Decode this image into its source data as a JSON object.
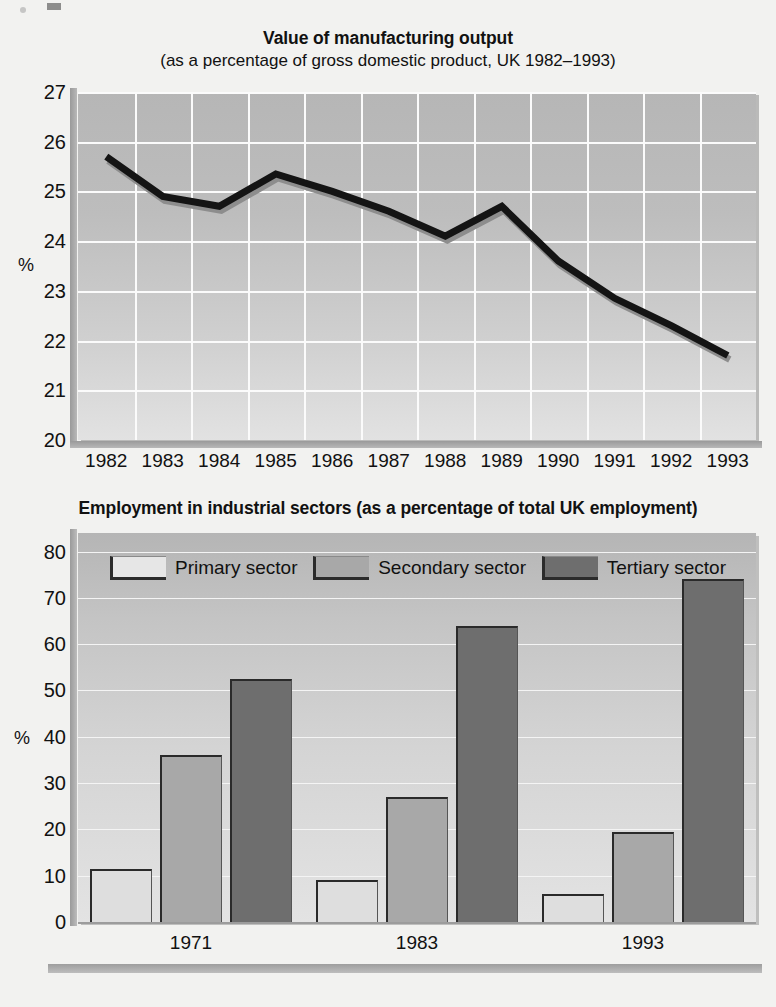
{
  "line_chart": {
    "title": "Value of manufacturing output",
    "subtitle": "(as a percentage of gross domestic product, UK 1982–1993)",
    "y_caption": "%"
  },
  "bar_chart": {
    "title": "Employment in industrial sectors (as a percentage of total UK employment)",
    "y_caption": "%",
    "legend": [
      {
        "label": "Primary sector",
        "key": "primary",
        "color": "#e6e6e6"
      },
      {
        "label": "Secondary sector",
        "key": "secondary",
        "color": "#a8a8a8"
      },
      {
        "label": "Tertiary sector",
        "key": "tertiary",
        "color": "#6e6e6e"
      }
    ]
  },
  "chart_data": [
    {
      "type": "line",
      "title": "Value of manufacturing output",
      "subtitle": "(as a percentage of gross domestic product, UK 1982–1993)",
      "xlabel": "",
      "ylabel": "%",
      "ylim": [
        20,
        27
      ],
      "yticks": [
        20,
        21,
        22,
        23,
        24,
        25,
        26,
        27
      ],
      "grid": true,
      "legend": "none",
      "categories": [
        "1982",
        "1983",
        "1984",
        "1985",
        "1986",
        "1987",
        "1988",
        "1989",
        "1990",
        "1991",
        "1992",
        "1993"
      ],
      "values": [
        25.7,
        24.9,
        24.7,
        25.35,
        25.0,
        24.6,
        24.1,
        24.7,
        23.6,
        22.85,
        22.3,
        21.7
      ],
      "series": [
        {
          "name": "Manufacturing output as % of GDP",
          "values": [
            25.7,
            24.9,
            24.7,
            25.35,
            25.0,
            24.6,
            24.1,
            24.7,
            23.6,
            22.85,
            22.3,
            21.7
          ],
          "color": "#111111"
        }
      ]
    },
    {
      "type": "bar",
      "title": "Employment in industrial sectors (as a percentage of total UK employment)",
      "xlabel": "",
      "ylabel": "%",
      "ylim": [
        0,
        84
      ],
      "yticks": [
        0,
        10,
        20,
        30,
        40,
        50,
        60,
        70,
        80
      ],
      "grid": true,
      "legend": "top",
      "categories": [
        "1971",
        "1983",
        "1993"
      ],
      "series": [
        {
          "name": "Primary sector",
          "values": [
            11.5,
            9.0,
            6.0
          ],
          "color": "#e6e6e6"
        },
        {
          "name": "Secondary sector",
          "values": [
            36.0,
            27.0,
            19.5
          ],
          "color": "#a8a8a8"
        },
        {
          "name": "Tertiary sector",
          "values": [
            52.5,
            64.0,
            74.0
          ],
          "color": "#6e6e6e"
        }
      ]
    }
  ]
}
